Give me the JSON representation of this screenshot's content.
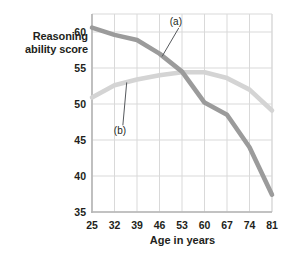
{
  "chart_data": {
    "type": "line",
    "title": "",
    "xlabel": "Age in years",
    "ylabel": "Reasoning ability score",
    "xticks": [
      "25",
      "32",
      "39",
      "46",
      "53",
      "60",
      "67",
      "74",
      "81"
    ],
    "yticks": [
      "35",
      "40",
      "45",
      "50",
      "55",
      "60"
    ],
    "xlim": [
      25,
      81
    ],
    "ylim": [
      35,
      62.5
    ],
    "grid": true,
    "legend_position": "inline-annotations",
    "x": [
      25,
      32,
      39,
      46,
      53,
      60,
      67,
      74,
      81
    ],
    "series": [
      {
        "name": "(a)",
        "label": "(a)",
        "color": "#9b9b9b",
        "values": [
          60.6,
          59.6,
          58.9,
          57.0,
          54.5,
          50.2,
          48.5,
          44.0,
          37.4
        ]
      },
      {
        "name": "(b)",
        "label": "(b)",
        "color": "#d4d4d4",
        "values": [
          50.9,
          52.6,
          53.4,
          54.0,
          54.4,
          54.4,
          53.6,
          52.0,
          49.1
        ]
      }
    ],
    "annotations": [
      {
        "text": "(a)",
        "x_data": 52,
        "y_data": 61.4,
        "leader_to_x": 46.8,
        "leader_to_y": 56.6
      },
      {
        "text": "(b)",
        "x_data": 34.6,
        "y_data": 46.2,
        "leader_to_x": 35.8,
        "leader_to_y": 53.0
      }
    ],
    "colors": {
      "series_a": "#9b9b9b",
      "series_b": "#d4d4d4",
      "grid": "#d9d9d9",
      "axis": "#b5b5b5",
      "text": "#231f20",
      "background": "#ffffff"
    }
  }
}
